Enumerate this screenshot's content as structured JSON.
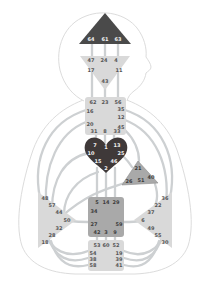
{
  "colors": {
    "background": "#ffffff",
    "body_outline": "#dcdcdc",
    "channel": "#cdd0d2",
    "center_undefined": "#d9d9d9",
    "center_defined_dark": "#4a4a4a",
    "center_defined_heart": "#3f3939",
    "center_defined_mid": "#a9a9a9",
    "center_mid_border": "#8d8d8d"
  },
  "centers": {
    "head": {
      "gates": {
        "g64": "64",
        "g61": "61",
        "g63": "63"
      }
    },
    "ajna": {
      "gates": {
        "g47": "47",
        "g24": "24",
        "g4": "4",
        "g17": "17",
        "g11": "11",
        "g43": "43"
      }
    },
    "throat": {
      "gates": {
        "g62": "62",
        "g23": "23",
        "g56": "56",
        "g16": "16",
        "g20": "20",
        "g35": "35",
        "g12": "12",
        "g45": "45",
        "g31": "31",
        "g8": "8",
        "g33": "33"
      }
    },
    "g_center": {
      "gates": {
        "g7": "7",
        "g1": "1",
        "g13": "13",
        "g10": "10",
        "g25": "25",
        "g15": "15",
        "g46": "46",
        "g2": "2"
      }
    },
    "ego": {
      "gates": {
        "g21": "21",
        "g26": "26",
        "g51": "51",
        "g40": "40"
      }
    },
    "spleen": {
      "gates": {
        "g48": "48",
        "g57": "57",
        "g44": "44",
        "g50": "50",
        "g32": "32",
        "g28": "28",
        "g18": "18"
      }
    },
    "solar_plexus": {
      "gates": {
        "g36": "36",
        "g22": "22",
        "g37": "37",
        "g6": "6",
        "g49": "49",
        "g55": "55",
        "g30": "30"
      }
    },
    "sacral": {
      "gates": {
        "g5": "5",
        "g14": "14",
        "g29": "29",
        "g34": "34",
        "g27": "27",
        "g59": "59",
        "g42": "42",
        "g3": "3",
        "g9": "9"
      }
    },
    "root": {
      "gates": {
        "g53": "53",
        "g60": "60",
        "g52": "52",
        "g54": "54",
        "g38": "38",
        "g58": "58",
        "g19": "19",
        "g39": "39",
        "g41": "41"
      }
    }
  }
}
